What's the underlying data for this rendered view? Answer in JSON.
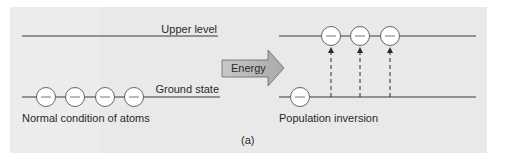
{
  "figure": {
    "panel_label": "(a)",
    "left": {
      "upper_level_label": "Upper level",
      "ground_state_label": "Ground state",
      "caption": "Normal condition of atoms",
      "upper_atoms": 0,
      "ground_atoms": 4
    },
    "arrow": {
      "label": "Energy"
    },
    "right": {
      "caption": "Population inversion",
      "upper_atoms": 3,
      "ground_atoms": 1,
      "excitation_arrows": 3
    },
    "colors": {
      "background": "#e9e9e9",
      "line": "#3a3a3a",
      "atom_fill": "#ffffff",
      "arrow_fill": "#b8b8b8",
      "text": "#2a2a2a"
    }
  }
}
